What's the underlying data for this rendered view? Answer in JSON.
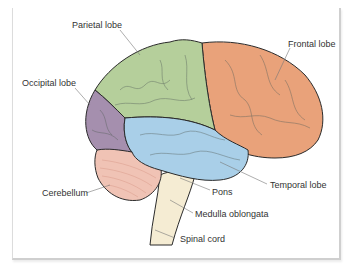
{
  "diagram": {
    "type": "anatomical-brain-lateral-view",
    "labels": {
      "parietal": "Parietal lobe",
      "frontal": "Frontal lobe",
      "occipital": "Occipital lobe",
      "temporal": "Temporal lobe",
      "cerebellum": "Cerebellum",
      "pons": "Pons",
      "medulla": "Medulla oblongata",
      "spinal": "Spinal cord"
    },
    "colors": {
      "parietal": "#b5cf9b",
      "frontal": "#e9a27a",
      "occipital": "#a58fae",
      "temporal": "#a9cfe8",
      "cerebellum": "#f0c3b5",
      "brainstem": "#f5ecd3",
      "outline": "#2b2b2b",
      "sulcus": "#55605a"
    }
  }
}
